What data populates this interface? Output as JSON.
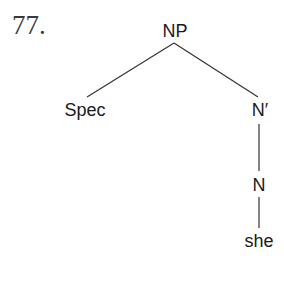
{
  "example_number": "77.",
  "tree": {
    "root": "NP",
    "spec": "Spec",
    "nbar": "N′",
    "n": "N",
    "word": "she"
  }
}
